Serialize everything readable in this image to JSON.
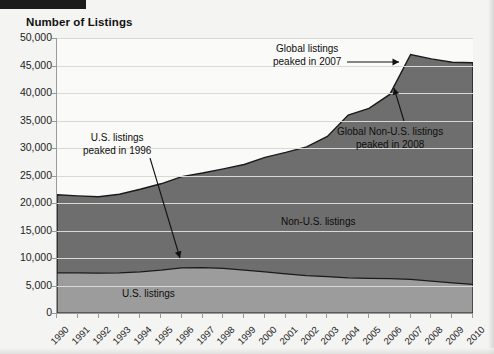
{
  "figure": {
    "title": "Number of Listings"
  },
  "chart_data": {
    "type": "area",
    "title": "Number of Listings",
    "xlabel": "",
    "ylabel": "Number of Listings",
    "stacked": true,
    "grid": true,
    "legend_position": "inline-labels",
    "ylim": [
      0,
      50000
    ],
    "ytick_labels": [
      "0",
      "5,000",
      "10,000",
      "15,000",
      "20,000",
      "25,000",
      "30,000",
      "35,000",
      "40,000",
      "45,000",
      "50,000"
    ],
    "ytick_values": [
      0,
      5000,
      10000,
      15000,
      20000,
      25000,
      30000,
      35000,
      40000,
      45000,
      50000
    ],
    "categories": [
      "1990",
      "1991",
      "1992",
      "1993",
      "1994",
      "1995",
      "1996",
      "1997",
      "1998",
      "1999",
      "2000",
      "2001",
      "2002",
      "2003",
      "2004",
      "2005",
      "2006",
      "2007",
      "2008",
      "2009",
      "2010"
    ],
    "series": [
      {
        "name": "U.S. listings",
        "color": "#9c9c9c",
        "values": [
          7300,
          7300,
          7250,
          7300,
          7500,
          7800,
          8200,
          8250,
          8100,
          7800,
          7500,
          7100,
          6800,
          6600,
          6400,
          6300,
          6250,
          6100,
          5800,
          5500,
          5200
        ]
      },
      {
        "name": "Non-U.S. listings",
        "color": "#6e6e6e",
        "values": [
          14200,
          14000,
          13900,
          14300,
          15000,
          15700,
          16600,
          17200,
          18100,
          19200,
          20800,
          22100,
          23400,
          25500,
          29600,
          30900,
          33500,
          40900,
          40400,
          40100,
          40300
        ]
      }
    ],
    "totals": [
      21500,
      21300,
      21150,
      21600,
      22500,
      23500,
      24800,
      25450,
      26200,
      27000,
      28300,
      29200,
      30200,
      32100,
      36000,
      37200,
      39750,
      47000,
      46200,
      45600,
      45500
    ],
    "annotations": [
      {
        "id": "us-peak",
        "text_line1": "U.S. listings",
        "text_line2": "peaked in 1996",
        "points_to_year": 1996
      },
      {
        "id": "global-peak",
        "text_line1": "Global listings",
        "text_line2": "peaked in 2007",
        "points_to_year": 2007
      },
      {
        "id": "nonus-peak",
        "text_line1": "Global Non-U.S. listings",
        "text_line2": "peaked in 2008",
        "points_to_year": 2008
      }
    ],
    "inline_labels": [
      {
        "id": "nonus-band-label",
        "text": "Non-U.S. listings"
      },
      {
        "id": "us-band-label",
        "text": "U.S. listings"
      }
    ]
  }
}
